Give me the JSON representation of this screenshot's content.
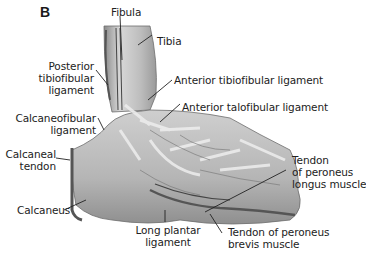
{
  "figure": {
    "panel_letter": "B",
    "colors": {
      "drawing_fill": "#c9c9c9",
      "drawing_dark": "#7a7a7a",
      "leader_line": "#222222",
      "background": "#ffffff"
    }
  },
  "labels": {
    "fibula": "Fibula",
    "tibia": "Tibia",
    "posterior_tibiofibular": [
      "Posterior",
      "tibiofibular",
      "ligament"
    ],
    "anterior_tibiofibular": "Anterior tibiofibular ligament",
    "anterior_talofibular": "Anterior talofibular ligament",
    "calcaneofibular": [
      "Calcaneofibular",
      "ligament"
    ],
    "calcaneal_tendon": [
      "Calcaneal",
      "tendon"
    ],
    "calcaneus": "Calcaneus",
    "long_plantar": [
      "Long plantar",
      "ligament"
    ],
    "peroneus_longus": [
      "Tendon",
      "of peroneus",
      "longus muscle"
    ],
    "peroneus_brevis": [
      "Tendon of peroneus",
      "brevis muscle"
    ]
  }
}
